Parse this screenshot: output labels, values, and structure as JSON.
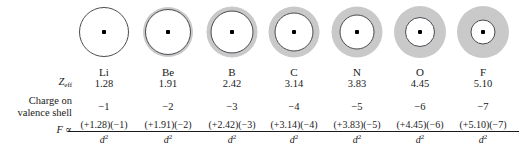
{
  "figure": {
    "colors": {
      "background": "#ffffff",
      "shell_halo": "#c9c9c9",
      "core_outline": "#4a4a52",
      "nucleus": "#000000",
      "text": "#1a1a1a"
    }
  },
  "row_labels": {
    "zeff": "Z",
    "zeff_sub": "eff",
    "charge_line1": "Charge on",
    "charge_line2": "valence shell",
    "force": "F",
    "force_proportional": "∝"
  },
  "denominator": {
    "base": "d",
    "exponent": "2"
  },
  "columns": [
    {
      "symbol": "Li",
      "zeff": "1.28",
      "charge": "−1",
      "numerator": "(+1.28)(−1)",
      "center_x": 104,
      "halo_diameter": 0,
      "core_diameter": 50
    },
    {
      "symbol": "Be",
      "zeff": "1.91",
      "charge": "−2",
      "numerator": "(+1.91)(−2)",
      "center_x": 168,
      "halo_diameter": 50,
      "core_diameter": 46
    },
    {
      "symbol": "B",
      "zeff": "2.42",
      "charge": "−3",
      "numerator": "(+2.42)(−3)",
      "center_x": 232,
      "halo_diameter": 51,
      "core_diameter": 43
    },
    {
      "symbol": "C",
      "zeff": "3.14",
      "charge": "−4",
      "numerator": "(+3.14)(−4)",
      "center_x": 294,
      "halo_diameter": 51,
      "core_diameter": 39
    },
    {
      "symbol": "N",
      "zeff": "3.83",
      "charge": "−5",
      "numerator": "(+3.83)(−5)",
      "center_x": 357,
      "halo_diameter": 51,
      "core_diameter": 35
    },
    {
      "symbol": "O",
      "zeff": "4.45",
      "charge": "−6",
      "numerator": "(+4.45)(−6)",
      "center_x": 420,
      "halo_diameter": 52,
      "core_diameter": 30
    },
    {
      "symbol": "F",
      "zeff": "5.10",
      "charge": "−7",
      "numerator": "(+5.10)(−7)",
      "center_x": 483,
      "halo_diameter": 52,
      "core_diameter": 25
    }
  ],
  "chart_data": {
    "type": "table",
    "categories": [
      "Li",
      "Be",
      "B",
      "C",
      "N",
      "O",
      "F"
    ],
    "series": [
      {
        "name": "Zeff",
        "values": [
          1.28,
          1.91,
          2.42,
          3.14,
          3.83,
          4.45,
          5.1
        ]
      },
      {
        "name": "Charge on valence shell",
        "values": [
          -1,
          -2,
          -3,
          -4,
          -5,
          -6,
          -7
        ]
      }
    ],
    "annotations": [
      "F ∝ (+1.28)(−1)/d²",
      "F ∝ (+1.91)(−2)/d²",
      "F ∝ (+2.42)(−3)/d²",
      "F ∝ (+3.14)(−4)/d²",
      "F ∝ (+3.83)(−5)/d²",
      "F ∝ (+4.45)(−6)/d²",
      "F ∝ (+5.10)(−7)/d²"
    ],
    "xlabel": "",
    "ylabel": "",
    "grid": false,
    "legend": "none"
  }
}
